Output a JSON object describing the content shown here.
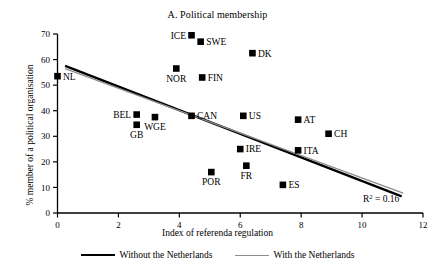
{
  "chart_data": {
    "type": "scatter",
    "title": "A. Political membership",
    "xlabel": "Index of referenda regulation",
    "ylabel": "% member of a political organisation",
    "xlim": [
      0,
      12
    ],
    "ylim": [
      0,
      70
    ],
    "xticks": [
      0,
      2,
      4,
      6,
      8,
      10,
      12
    ],
    "yticks": [
      0,
      10,
      20,
      30,
      40,
      50,
      60,
      70
    ],
    "grid": false,
    "annotation": "R² = 0.16",
    "r_squared": 0.16,
    "points": [
      {
        "label": "NL",
        "x": 0.0,
        "y": 53.5,
        "label_pos": "right"
      },
      {
        "label": "BEL",
        "x": 2.6,
        "y": 38.5,
        "label_pos": "left"
      },
      {
        "label": "GB",
        "x": 2.6,
        "y": 34.5,
        "label_pos": "below"
      },
      {
        "label": "WGE",
        "x": 3.2,
        "y": 37.5,
        "label_pos": "below"
      },
      {
        "label": "NOR",
        "x": 3.9,
        "y": 56.5,
        "label_pos": "below"
      },
      {
        "label": "ICE",
        "x": 4.4,
        "y": 69.5,
        "label_pos": "left"
      },
      {
        "label": "SWE",
        "x": 4.7,
        "y": 67.0,
        "label_pos": "right"
      },
      {
        "label": "FIN",
        "x": 4.75,
        "y": 53.0,
        "label_pos": "right"
      },
      {
        "label": "CAN",
        "x": 4.4,
        "y": 38.0,
        "label_pos": "right"
      },
      {
        "label": "POR",
        "x": 5.05,
        "y": 16.0,
        "label_pos": "below"
      },
      {
        "label": "IRE",
        "x": 6.0,
        "y": 25.0,
        "label_pos": "right"
      },
      {
        "label": "FR",
        "x": 6.2,
        "y": 18.5,
        "label_pos": "below"
      },
      {
        "label": "US",
        "x": 6.1,
        "y": 38.0,
        "label_pos": "right"
      },
      {
        "label": "DK",
        "x": 6.4,
        "y": 62.5,
        "label_pos": "right"
      },
      {
        "label": "ES",
        "x": 7.4,
        "y": 11.0,
        "label_pos": "right"
      },
      {
        "label": "ITA",
        "x": 7.9,
        "y": 24.5,
        "label_pos": "right"
      },
      {
        "label": "AT",
        "x": 7.9,
        "y": 36.5,
        "label_pos": "right"
      },
      {
        "label": "CH",
        "x": 8.9,
        "y": 31.0,
        "label_pos": "right"
      }
    ],
    "series": [
      {
        "name": "Without the Netherlands",
        "type": "line",
        "color": "#000000",
        "width": 2.4,
        "x": [
          0.25,
          11.3
        ],
        "y": [
          57.5,
          6.5
        ]
      },
      {
        "name": "With the Netherlands",
        "type": "line",
        "color": "#8c8c8c",
        "width": 1.3,
        "x": [
          0.25,
          11.35
        ],
        "y": [
          56.5,
          7.8
        ]
      }
    ],
    "legend_position": "below-axis",
    "legend": [
      {
        "label": "Without the Netherlands",
        "color": "#000000",
        "style": "thick"
      },
      {
        "label": "With the Netherlands",
        "color": "#8c8c8c",
        "style": "thin"
      }
    ]
  }
}
